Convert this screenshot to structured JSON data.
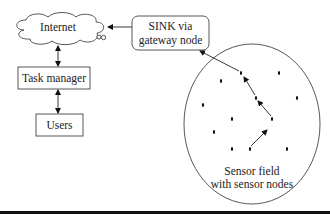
{
  "diagram": {
    "nodes": {
      "internet": {
        "label": "Internet",
        "shape": "cloud"
      },
      "sink": {
        "label_line1": "SINK via",
        "label_line2": "gateway node",
        "shape": "rounded-rect"
      },
      "task_manager": {
        "label": "Task manager",
        "shape": "rect"
      },
      "users": {
        "label": "Users",
        "shape": "rect"
      },
      "sensor_field": {
        "label_line1": "Sensor field",
        "label_line2": "with sensor nodes",
        "shape": "ellipse"
      }
    },
    "edges": [
      {
        "from": "sink",
        "to": "internet",
        "direction": "one-way"
      },
      {
        "from": "internet",
        "to": "task_manager",
        "direction": "two-way"
      },
      {
        "from": "task_manager",
        "to": "users",
        "direction": "two-way"
      },
      {
        "from": "sensor_field",
        "to": "sink",
        "direction": "multi-hop"
      }
    ],
    "sensor_node_count": 15,
    "colors": {
      "stroke": "#222222",
      "background": "#ffffff",
      "bottom_bar": "#111111"
    }
  }
}
